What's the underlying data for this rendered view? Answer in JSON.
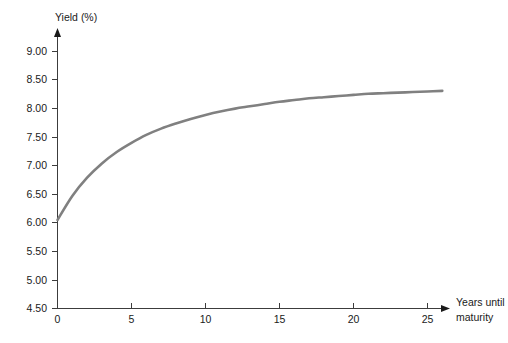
{
  "chart_data": {
    "type": "line",
    "title": "",
    "subtitle": "",
    "xlabel": "Years until maturity",
    "ylabel": "Yield (%)",
    "xlim": [
      0,
      26
    ],
    "ylim": [
      4.5,
      9.25
    ],
    "grid": false,
    "legend": null,
    "legend_position": "none",
    "xticks": [
      0,
      5,
      10,
      15,
      20,
      25
    ],
    "xtick_labels": [
      "0",
      "5",
      "10",
      "15",
      "20",
      "25"
    ],
    "yticks": [
      4.5,
      5.0,
      5.5,
      6.0,
      6.5,
      7.0,
      7.5,
      8.0,
      8.5,
      9.0
    ],
    "ytick_labels": [
      "4.50",
      "5.00",
      "5.50",
      "6.00",
      "6.50",
      "7.00",
      "7.50",
      "8.00",
      "8.50",
      "9.00"
    ],
    "series": [
      {
        "name": "Yield curve",
        "color": "#808080",
        "x": [
          0,
          1,
          2,
          3,
          4,
          5,
          6,
          7,
          8,
          9,
          10,
          11,
          12,
          13,
          14,
          15,
          16,
          17,
          18,
          19,
          20,
          21,
          22,
          23,
          24,
          25,
          26
        ],
        "y": [
          6.05,
          6.47,
          6.79,
          7.04,
          7.24,
          7.4,
          7.54,
          7.65,
          7.74,
          7.82,
          7.89,
          7.95,
          8.0,
          8.04,
          8.08,
          8.12,
          8.15,
          8.18,
          8.2,
          8.22,
          8.24,
          8.26,
          8.27,
          8.28,
          8.29,
          8.3,
          8.31
        ]
      }
    ],
    "annotations": []
  },
  "axes": {
    "y_axis_title": "Yield (%)",
    "x_axis_title_line1": "Years until",
    "x_axis_title_line2": "maturity",
    "y_arrow": "up-arrow-icon",
    "x_arrow": "right-arrow-icon"
  },
  "colors": {
    "curve": "#808080",
    "axis": "#3c3c3c",
    "text": "#1a1a1a",
    "background": "#ffffff"
  }
}
